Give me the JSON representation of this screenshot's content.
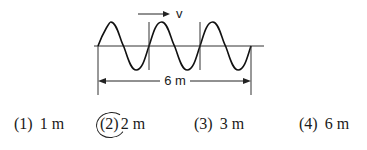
{
  "diagram": {
    "velocity_label": "v",
    "dimension_label": "6 m",
    "wave": {
      "wavelengths": 3,
      "x_start": 98,
      "x_end": 251,
      "axis_y": 46,
      "amplitude": 24
    }
  },
  "options": [
    {
      "number": "(1)",
      "value": "1 m",
      "selected": false
    },
    {
      "number": "(2)",
      "value": "2 m",
      "selected": true
    },
    {
      "number": "(3)",
      "value": "3 m",
      "selected": false
    },
    {
      "number": "(4)",
      "value": "6 m",
      "selected": false
    }
  ]
}
